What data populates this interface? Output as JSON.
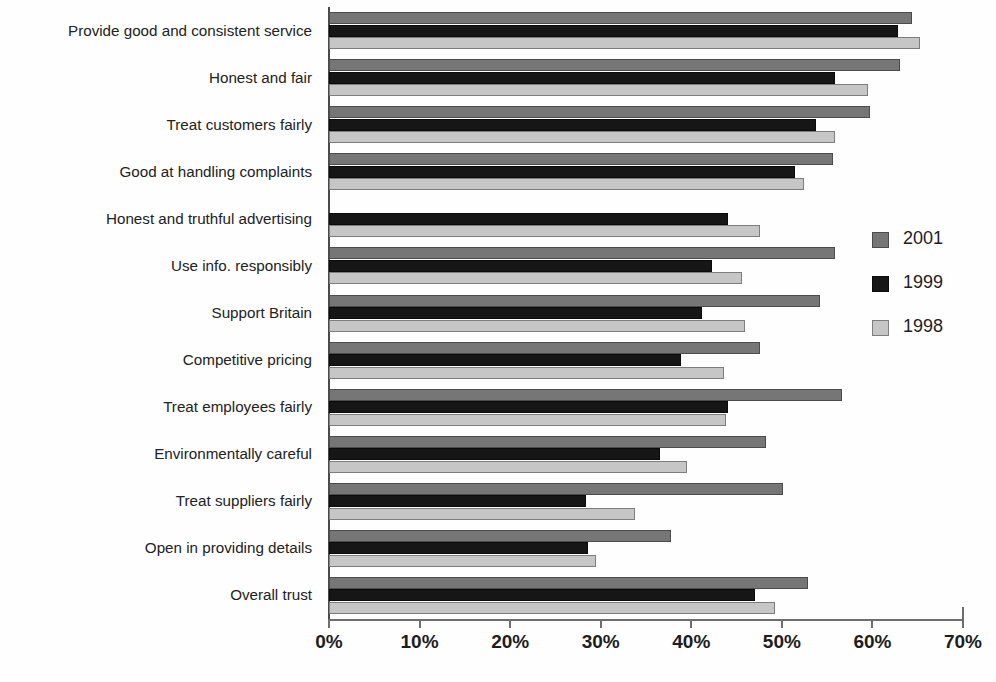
{
  "chart_data": {
    "type": "bar",
    "orientation": "horizontal",
    "title": "",
    "xlabel": "",
    "ylabel": "",
    "xlim": [
      0,
      70
    ],
    "xticks": [
      "0%",
      "10%",
      "20%",
      "30%",
      "40%",
      "50%",
      "60%",
      "70%"
    ],
    "xtick_values": [
      0,
      10,
      20,
      30,
      40,
      50,
      60,
      70
    ],
    "grid": false,
    "legend_position": "right",
    "categories": [
      "Provide good and consistent service",
      "Honest and fair",
      "Treat customers fairly",
      "Good at handling complaints",
      "Honest and truthful advertising",
      "Use info. responsibly",
      "Support Britain",
      "Competitive pricing",
      "Treat employees fairly",
      "Environmentally careful",
      "Treat suppliers fairly",
      "Open in providing details",
      "Overall trust"
    ],
    "series": [
      {
        "name": "2001",
        "color": "#767676",
        "values": [
          64.4,
          63.0,
          59.7,
          55.6,
          null,
          55.9,
          54.2,
          47.6,
          56.6,
          48.2,
          50.1,
          37.8,
          52.9
        ]
      },
      {
        "name": "1999",
        "color": "#161616",
        "values": [
          62.8,
          55.9,
          53.8,
          51.4,
          44.1,
          42.3,
          41.2,
          38.9,
          44.0,
          36.5,
          28.4,
          28.6,
          47.0
        ]
      },
      {
        "name": "1998",
        "color": "#c6c6c6",
        "values": [
          65.2,
          59.5,
          55.9,
          52.4,
          47.6,
          45.6,
          45.9,
          43.6,
          43.8,
          39.5,
          33.8,
          29.5,
          49.2
        ]
      }
    ]
  },
  "legend": {
    "entries": [
      {
        "label": "2001",
        "swatch": "s2001"
      },
      {
        "label": "1999",
        "swatch": "s1999"
      },
      {
        "label": "1998",
        "swatch": "s1998"
      }
    ]
  }
}
